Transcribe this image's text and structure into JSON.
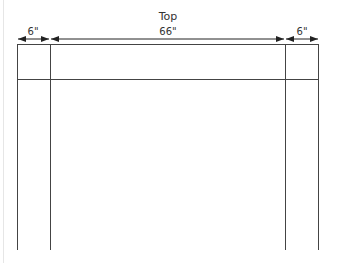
{
  "diagram": {
    "title": "Top",
    "dimensions": [
      {
        "label": "6\"",
        "x1": 17,
        "x2": 50
      },
      {
        "label": "66\"",
        "x1": 50,
        "x2": 285
      },
      {
        "label": "6\"",
        "x1": 285,
        "x2": 319
      }
    ],
    "line_color": "#333333",
    "frame": {
      "left": 17,
      "inner_left": 50,
      "inner_right": 285,
      "right": 319,
      "top": 44,
      "rail": 79,
      "bottom": 250
    }
  }
}
